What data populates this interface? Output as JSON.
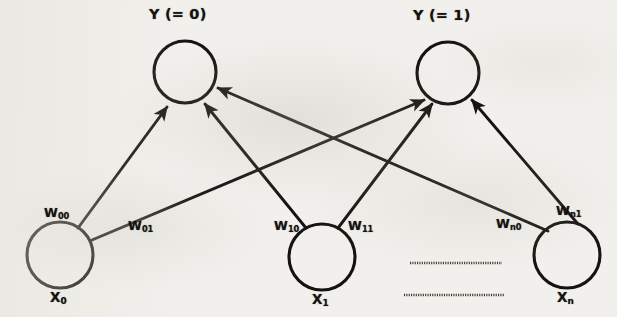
{
  "figure": {
    "kind": "neural-network-diagram",
    "width": 617,
    "height": 317,
    "background_color": "#f2f0ec",
    "stroke_color": "#15120f"
  },
  "output_nodes": [
    {
      "id": "y0",
      "label": "Y (= 0)",
      "cx": 185,
      "cy": 72,
      "r": 31
    },
    {
      "id": "y1",
      "label": "Y (= 1)",
      "cx": 448,
      "cy": 73,
      "r": 31
    }
  ],
  "input_nodes": [
    {
      "id": "x0",
      "base": "X",
      "sub": "0",
      "cx": 60,
      "cy": 255,
      "r": 33
    },
    {
      "id": "x1",
      "base": "X",
      "sub": "1",
      "cx": 322,
      "cy": 257,
      "r": 33
    },
    {
      "id": "xn",
      "base": "X",
      "sub": "n",
      "cx": 567,
      "cy": 255,
      "r": 33
    }
  ],
  "weights": [
    {
      "id": "w00",
      "base": "W",
      "sub": "00",
      "from": "x0",
      "to": "y0",
      "x": 44,
      "y": 205
    },
    {
      "id": "w01",
      "base": "W",
      "sub": "01",
      "from": "x0",
      "to": "y1",
      "x": 128,
      "y": 218
    },
    {
      "id": "w10",
      "base": "W",
      "sub": "10",
      "from": "x1",
      "to": "y0",
      "x": 274,
      "y": 218
    },
    {
      "id": "w11",
      "base": "W",
      "sub": "11",
      "from": "x1",
      "to": "y1",
      "x": 348,
      "y": 218
    },
    {
      "id": "wn0",
      "base": "W",
      "sub": "n0",
      "from": "xn",
      "to": "y0",
      "x": 496,
      "y": 216
    },
    {
      "id": "wn1",
      "base": "W",
      "sub": "n1",
      "from": "xn",
      "to": "y1",
      "x": 556,
      "y": 203
    }
  ],
  "ellipsis_lines": [
    {
      "id": "ellipsis-upper",
      "x1": 410,
      "y1": 263,
      "x2": 502,
      "y2": 263
    },
    {
      "id": "ellipsis-lower",
      "x1": 404,
      "y1": 295,
      "x2": 504,
      "y2": 295
    }
  ]
}
